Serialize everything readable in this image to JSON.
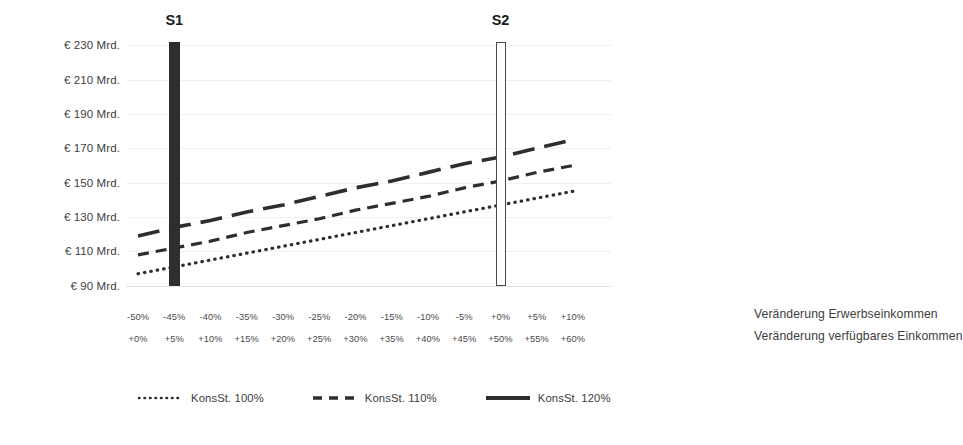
{
  "chart_data": {
    "type": "line",
    "title": "",
    "xlabel": "",
    "ylabel": "",
    "grid": true,
    "legend_position": "bottom",
    "y_axis": {
      "ticks": [
        "€ 230 Mrd.",
        "€ 210 Mrd.",
        "€ 190 Mrd.",
        "€ 170 Mrd.",
        "€ 150 Mrd.",
        "€ 130 Mrd.",
        "€ 110 Mrd.",
        "€ 90 Mrd."
      ],
      "values": [
        230,
        210,
        190,
        170,
        150,
        130,
        110,
        90
      ],
      "ylim": [
        80,
        240
      ],
      "unit": "Mrd. €"
    },
    "x_axis": {
      "row1_label": "Veränderung Erwerbseinkommen",
      "row2_label": "Veränderung verfügbares Einkommen",
      "row1_ticks": [
        "-50%",
        "-45%",
        "-40%",
        "-35%",
        "-30%",
        "-25%",
        "-20%",
        "-15%",
        "-10%",
        "-5%",
        "+0%",
        "+5%",
        "+10%"
      ],
      "row2_ticks": [
        "+0%",
        "+5%",
        "+10%",
        "+15%",
        "+20%",
        "+25%",
        "+30%",
        "+35%",
        "+40%",
        "+45%",
        "+50%",
        "+55%",
        "+60%"
      ],
      "row1_values": [
        -50,
        -45,
        -40,
        -35,
        -30,
        -25,
        -20,
        -15,
        -10,
        -5,
        0,
        5,
        10
      ],
      "row2_values": [
        0,
        5,
        10,
        15,
        20,
        25,
        30,
        35,
        40,
        45,
        50,
        55,
        60
      ]
    },
    "categories": [
      "-50%",
      "-45%",
      "-40%",
      "-35%",
      "-30%",
      "-25%",
      "-20%",
      "-15%",
      "-10%",
      "-5%",
      "+0%",
      "+5%",
      "+10%"
    ],
    "series": [
      {
        "name": "KonsSt. 100%",
        "style": "dotted",
        "color": "#2e2e2e",
        "values": [
          97,
          101,
          105,
          109,
          113,
          117,
          121,
          125,
          129,
          133,
          137,
          141,
          145
        ]
      },
      {
        "name": "KonsSt. 110%",
        "style": "dashed",
        "color": "#2e2e2e",
        "values": [
          108,
          112,
          116,
          121,
          125,
          129,
          134,
          138,
          142,
          147,
          151,
          156,
          160
        ]
      },
      {
        "name": "KonsSt. 120%",
        "style": "long-dashed",
        "color": "#2e2e2e",
        "values": [
          119,
          124,
          128,
          133,
          137,
          142,
          147,
          151,
          156,
          161,
          165,
          170,
          175
        ]
      }
    ],
    "markers": [
      {
        "label": "S1",
        "x_row1": "-45%",
        "x_row2": "+5%",
        "x_index": 1,
        "fill": "filled",
        "top_value": 232,
        "bottom_value": 90,
        "color": "#2e2e2e"
      },
      {
        "label": "S2",
        "x_row1": "+0%",
        "x_row2": "+50%",
        "x_index": 10,
        "fill": "hollow",
        "top_value": 232,
        "bottom_value": 90,
        "color": "#4a4a4a"
      }
    ],
    "legend": [
      {
        "label": "KonsSt. 100%",
        "style": "dotted"
      },
      {
        "label": "KonsSt. 110%",
        "style": "dashed"
      },
      {
        "label": "KonsSt. 120%",
        "style": "solid"
      }
    ],
    "colors": {
      "line": "#2e2e2e",
      "gridline": "#f0f0f0",
      "baseline": "#e3e3e3",
      "text": "#3d3d3d",
      "marker_filled": "#2e2e2e",
      "marker_hollow_border": "#4a4a4a"
    }
  }
}
